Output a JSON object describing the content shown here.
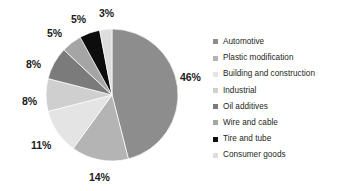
{
  "chart_data": {
    "type": "pie",
    "title": "",
    "subtitle": "",
    "xlabel": "",
    "ylabel": "",
    "legend_position": "right",
    "grid": false,
    "start_angle_deg": 0,
    "direction": "clockwise",
    "categories": [
      "Automotive",
      "Plastic modification",
      "Building and construction",
      "Industrial",
      "Oil additives",
      "Wire and cable",
      "Tire and tube",
      "Consumer goods"
    ],
    "values": [
      46,
      14,
      11,
      8,
      8,
      5,
      5,
      3
    ],
    "value_labels": [
      "46%",
      "14%",
      "11%",
      "8%",
      "8%",
      "5%",
      "5%",
      "3%"
    ],
    "colors": [
      "#8d8d8d",
      "#b4b4b4",
      "#e4e4e4",
      "#cfcfcf",
      "#7b7b7b",
      "#a5a5a5",
      "#0d0d0d",
      "#dedede"
    ],
    "slices": [
      {
        "label": "Automotive",
        "value": 46,
        "value_label": "46%",
        "color": "#8d8d8d"
      },
      {
        "label": "Plastic modification",
        "value": 14,
        "value_label": "14%",
        "color": "#b4b4b4"
      },
      {
        "label": "Building and construction",
        "value": 11,
        "value_label": "11%",
        "color": "#e4e4e4"
      },
      {
        "label": "Industrial",
        "value": 8,
        "value_label": "8%",
        "color": "#cfcfcf"
      },
      {
        "label": "Oil additives",
        "value": 8,
        "value_label": "8%",
        "color": "#7b7b7b"
      },
      {
        "label": "Wire and cable",
        "value": 5,
        "value_label": "5%",
        "color": "#a5a5a5"
      },
      {
        "label": "Tire and tube",
        "value": 5,
        "value_label": "5%",
        "color": "#0d0d0d"
      },
      {
        "label": "Consumer goods",
        "value": 3,
        "value_label": "3%",
        "color": "#dedede"
      }
    ]
  },
  "legend": {
    "items": [
      {
        "label": "Automotive",
        "color": "#8d8d8d"
      },
      {
        "label": "Plastic modification",
        "color": "#b4b4b4"
      },
      {
        "label": "Building and construction",
        "color": "#e4e4e4"
      },
      {
        "label": "Industrial",
        "color": "#cfcfcf"
      },
      {
        "label": "Oil additives",
        "color": "#7b7b7b"
      },
      {
        "label": "Wire and cable",
        "color": "#a5a5a5"
      },
      {
        "label": "Tire and tube",
        "color": "#0d0d0d"
      },
      {
        "label": "Consumer goods",
        "color": "#dedede"
      }
    ]
  },
  "pie_geometry": {
    "center_x": 112,
    "center_y": 95,
    "radius": 66
  },
  "label_positions": [
    {
      "value_label": "46%",
      "x": 180,
      "y": 72
    },
    {
      "value_label": "14%",
      "x": 89,
      "y": 172
    },
    {
      "value_label": "11%",
      "x": 31,
      "y": 140
    },
    {
      "value_label": "8%",
      "x": 22,
      "y": 96
    },
    {
      "value_label": "8%",
      "x": 26,
      "y": 59
    },
    {
      "value_label": "5%",
      "x": 47,
      "y": 28
    },
    {
      "value_label": "5%",
      "x": 71,
      "y": 14
    },
    {
      "value_label": "3%",
      "x": 99,
      "y": 8
    }
  ]
}
